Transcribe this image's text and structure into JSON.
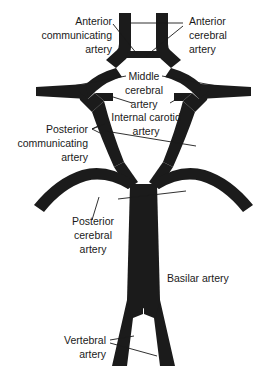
{
  "figure": {
    "background_color": "#ffffff",
    "vessel_color": "#1b1b1b",
    "leader_color": "#1a1a1a",
    "text_color": "#1a1a1a",
    "width": 275,
    "height": 372
  },
  "labels": {
    "anterior_communicating": {
      "line1": "Anterior",
      "line2": "communicating",
      "line3": "artery"
    },
    "anterior_cerebral": {
      "line1": "Anterior",
      "line2": "cerebral",
      "line3": "artery"
    },
    "middle_cerebral": {
      "line1": "Middle",
      "line2": "cerebral",
      "line3": "artery"
    },
    "internal_carotid": {
      "line1": "Internal carotid",
      "line2": "artery"
    },
    "posterior_communicating": {
      "line1": "Posterior",
      "line2": "communicating",
      "line3": "artery"
    },
    "posterior_cerebral": {
      "line1": "Posterior",
      "line2": "cerebral",
      "line3": "artery"
    },
    "basilar": {
      "line1": "Basilar artery"
    },
    "vertebral": {
      "line1": "Vertebral",
      "line2": "artery"
    }
  }
}
